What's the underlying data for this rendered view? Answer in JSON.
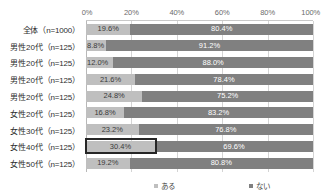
{
  "chart_data": {
    "type": "bar",
    "orientation": "horizontal",
    "stacked": true,
    "stack_mode": "percent",
    "title": "",
    "subtitle": "",
    "xlabel": "",
    "ylabel": "",
    "xlim": [
      0,
      100
    ],
    "grid": true,
    "legend_position": "bottom",
    "xtick_labels": [
      "0%",
      "20%",
      "40%",
      "60%",
      "80%",
      "100%"
    ],
    "xtick_values": [
      0,
      20,
      40,
      60,
      80,
      100
    ],
    "categories": [
      "全体（n=1000）",
      "男性20代（n=125）",
      "男性20代（n=125）",
      "男性20代（n=125）",
      "男性20代（n=125）",
      "女性20代（n=125）",
      "女性30代（n=125）",
      "女性40代（n=125）",
      "女性50代（n=125）"
    ],
    "series": [
      {
        "name": "ある",
        "color": "#bfbfbf",
        "values": [
          19.6,
          8.8,
          12.0,
          21.6,
          24.8,
          16.8,
          23.2,
          30.4,
          19.2
        ],
        "labels": [
          "19.6%",
          "8.8%",
          "12.0%",
          "21.6%",
          "24.8%",
          "16.8%",
          "23.2%",
          "30.4%",
          "19.2%"
        ]
      },
      {
        "name": "ない",
        "color": "#808080",
        "values": [
          80.4,
          91.2,
          88.0,
          78.4,
          75.2,
          83.2,
          76.8,
          69.6,
          80.8
        ],
        "labels": [
          "80.4%",
          "91.2%",
          "88.0%",
          "78.4%",
          "75.2%",
          "83.2%",
          "76.8%",
          "69.6%",
          "80.8%"
        ]
      }
    ],
    "annotations": [
      {
        "type": "highlight-box",
        "target_row_index": 7,
        "target_series_index": 0,
        "target_label": "30.4%",
        "color": "#262626"
      }
    ]
  },
  "legend": {
    "items": [
      {
        "label": "ある",
        "color": "#bfbfbf"
      },
      {
        "label": "ない",
        "color": "#808080"
      }
    ]
  }
}
